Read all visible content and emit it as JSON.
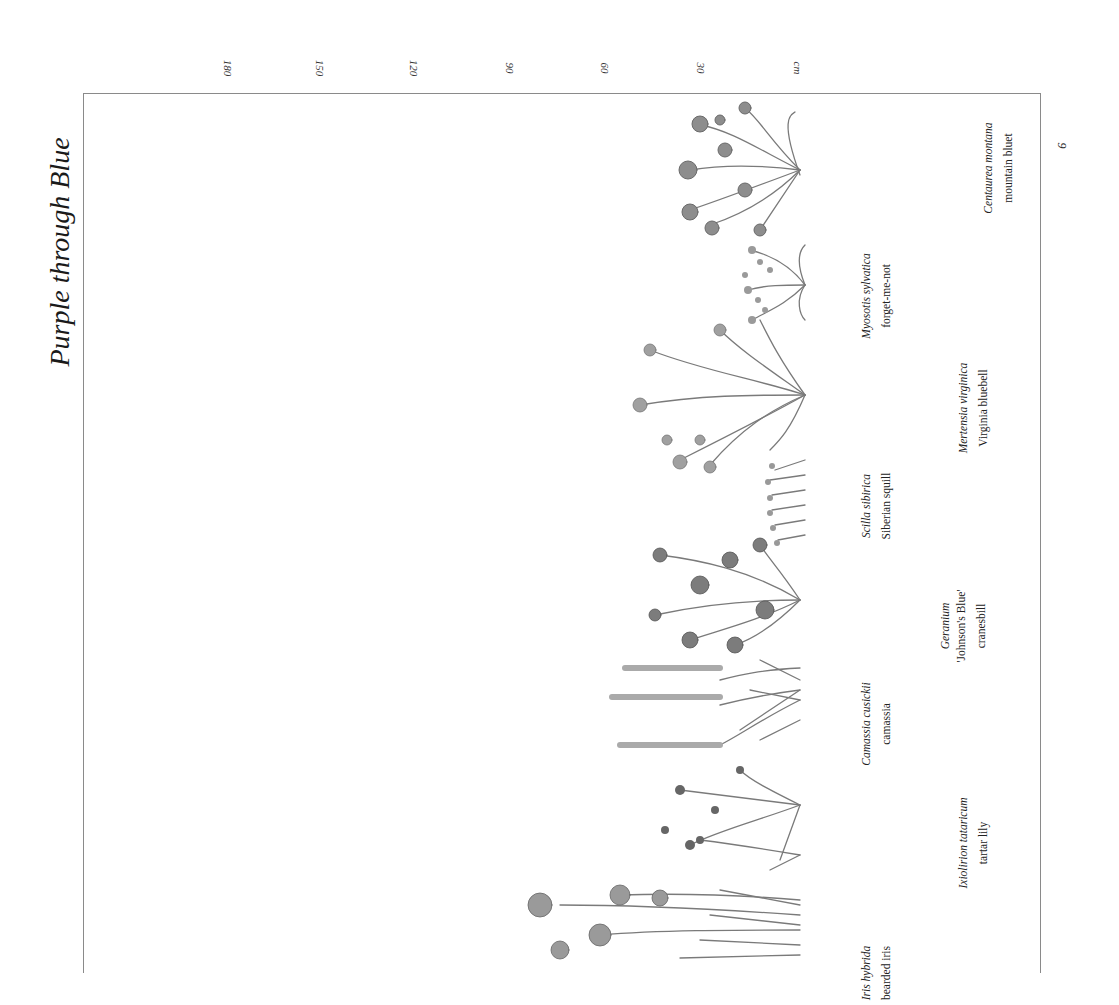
{
  "page": {
    "title": "Purple through Blue",
    "page_number": "9",
    "scale_unit": "cm",
    "scale_ticks": [
      "180",
      "150",
      "120",
      "90",
      "60",
      "30",
      "cm"
    ]
  },
  "plants": [
    {
      "scientific": "Centaurea montana",
      "common": "mountain bluet"
    },
    {
      "scientific": "Myosotis sylvatica",
      "common": "forget-me-not"
    },
    {
      "scientific": "Mertensia virginica",
      "common": "Virginia bluebell"
    },
    {
      "scientific": "Scilla sibirica",
      "common": "Siberian squill"
    },
    {
      "scientific": "Geranium",
      "cultivar": "'Johnson's Blue'",
      "common": "cranesbill"
    },
    {
      "scientific": "Camassia cusickii",
      "common": "camassia"
    },
    {
      "scientific": "Ixiolirion tataricum",
      "common": "tartar lily"
    },
    {
      "scientific": "Iris hybrida",
      "common": "bearded iris"
    }
  ],
  "colors": {
    "ink": "#222222",
    "frame": "#8a8a8a",
    "illustration": "#6f6f6f"
  }
}
